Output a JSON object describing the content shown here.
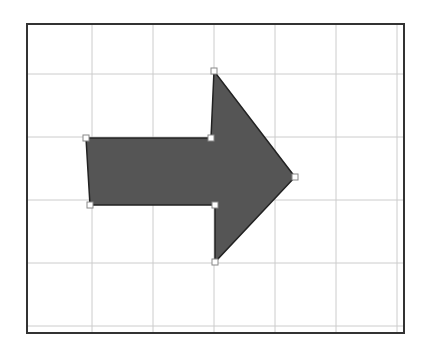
{
  "caption": {
    "visible": "clipped",
    "text": ""
  },
  "canvas": {
    "frame": {
      "x": 27,
      "y": 24,
      "width": 377,
      "height": 309,
      "stroke": "#333333"
    },
    "grid": {
      "color": "#cccccc",
      "vertical_x": [
        92,
        153,
        214,
        275,
        336,
        397
      ],
      "horizontal_y": [
        74,
        137,
        200,
        263,
        326
      ]
    }
  },
  "shape": {
    "type": "right-arrow",
    "fill": "#555555",
    "stroke": "#222222",
    "points": [
      [
        86,
        138
      ],
      [
        211,
        138
      ],
      [
        214,
        71
      ],
      [
        295,
        177
      ],
      [
        215,
        262
      ],
      [
        215,
        205
      ],
      [
        90,
        205
      ]
    ],
    "handle_color": "#ffffff",
    "handle_stroke": "#888888"
  }
}
